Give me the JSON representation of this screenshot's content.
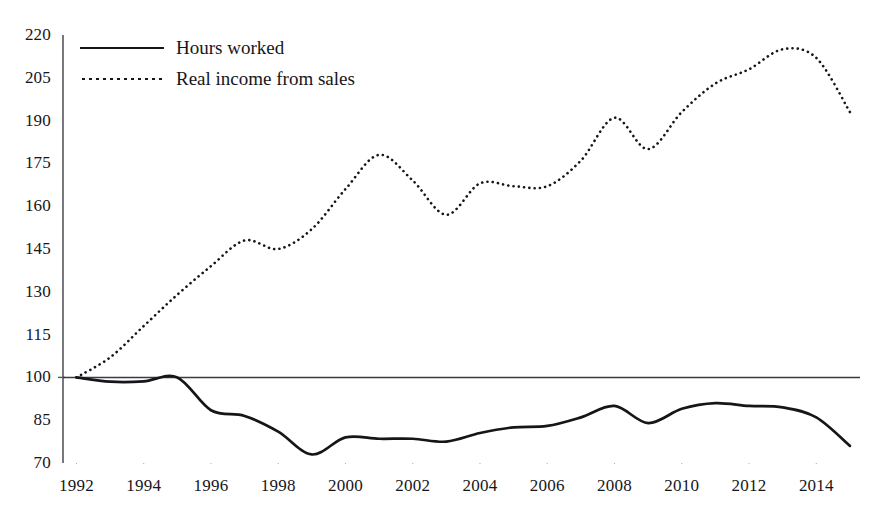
{
  "chart_data": {
    "type": "line",
    "title": "",
    "subtitle": "",
    "xlabel": "",
    "ylabel": "",
    "xlim": [
      1991.6,
      2015.3
    ],
    "ylim": [
      70,
      220
    ],
    "yticks": [
      70,
      85,
      100,
      115,
      130,
      145,
      160,
      175,
      190,
      205,
      220
    ],
    "xticks": [
      1992,
      1994,
      1996,
      1998,
      2000,
      2002,
      2004,
      2006,
      2008,
      2010,
      2012,
      2014
    ],
    "grid": false,
    "legend_position": "top-left",
    "reference_line": 100,
    "x": [
      1992,
      1993,
      1994,
      1995,
      1996,
      1997,
      1998,
      1999,
      2000,
      2001,
      2002,
      2003,
      2004,
      2005,
      2006,
      2007,
      2008,
      2009,
      2010,
      2011,
      2012,
      2013,
      2014,
      2015
    ],
    "series": [
      {
        "name": "Hours worked",
        "style": "solid",
        "color": "#16161a",
        "values": [
          100,
          98.5,
          98.6,
          100,
          88.5,
          86.5,
          81,
          73,
          79,
          78.5,
          78.5,
          77.5,
          80.5,
          82.5,
          83,
          86,
          90,
          84,
          89,
          91,
          90,
          89.5,
          86,
          76
        ]
      },
      {
        "name": "Real income from sales",
        "style": "dotted",
        "color": "#16161a",
        "values": [
          100,
          107,
          118,
          129,
          139,
          148,
          145,
          152,
          166,
          178,
          169,
          157,
          168,
          167,
          167,
          176,
          191,
          180,
          193,
          203,
          208,
          215,
          212,
          193
        ]
      }
    ]
  },
  "legend": {
    "items": [
      {
        "label": "Hours worked",
        "style": "solid"
      },
      {
        "label": "Real income from sales",
        "style": "dotted"
      }
    ]
  },
  "axis": {
    "y_labels": [
      "220",
      "205",
      "190",
      "175",
      "160",
      "145",
      "130",
      "115",
      "100",
      "85",
      "70"
    ],
    "x_labels": [
      "1992",
      "1994",
      "1996",
      "1998",
      "2000",
      "2002",
      "2004",
      "2006",
      "2008",
      "2010",
      "2012",
      "2014"
    ]
  }
}
